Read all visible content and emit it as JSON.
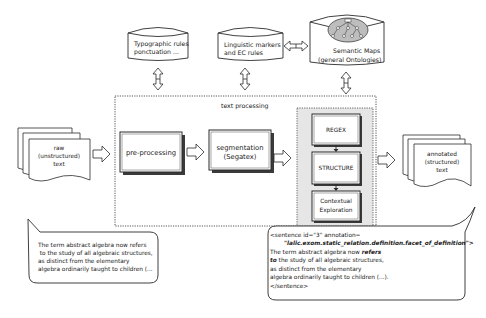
{
  "diagram": {
    "knowledge_bases": [
      {
        "id": "typographic",
        "lines": [
          "Typographic rules",
          "ponctuation ..."
        ]
      },
      {
        "id": "linguistic",
        "lines": [
          "Linguistic markers",
          "and EC rules"
        ]
      },
      {
        "id": "semantic",
        "lines": [
          "Semantic Maps",
          "(general Ontologies)"
        ]
      }
    ],
    "container_label": "text processing",
    "input_doc": {
      "lines": [
        "raw",
        "(unstructured)",
        "text"
      ]
    },
    "output_doc": {
      "lines": [
        "annotated",
        "(structured)",
        "text"
      ]
    },
    "steps": [
      {
        "id": "pre-processing",
        "lines": [
          "pre-processing"
        ]
      },
      {
        "id": "segmentation",
        "lines": [
          "segmentation",
          "(Segatex)"
        ]
      }
    ],
    "annotation_steps": [
      {
        "id": "regex",
        "lines": [
          "REGEX"
        ]
      },
      {
        "id": "structure",
        "lines": [
          "STRUCTURE"
        ]
      },
      {
        "id": "contextual",
        "lines": [
          "Contextual",
          "Exploration"
        ]
      }
    ],
    "input_example": {
      "lines": [
        "The term abstract algebra now refers",
        " to the study of all algebraic structures,",
        "as distinct from the elementary",
        "algebra ordinarily taught to children (..."
      ]
    },
    "output_example": {
      "tag_open": "<sentence id=\"3\" annotation=",
      "annotation_value": "\"lalic.exom.static_relation.definition.facet_of_definition\">",
      "line1_plain": "The term abstract algebra now ",
      "line1_bold": "refers",
      "line2_bold": "to",
      "line2_plain": " the study of all algebraic structures,",
      "line3": "as distinct from the elementary",
      "line4": "algebra ordinarily taught to children (...).",
      "tag_close": "</sentence>"
    }
  },
  "colors": {
    "stroke": "#2b2b2b",
    "shadow": "#3a3a3a",
    "inner_panel": "#e6e6e6",
    "ontology_fill": "#bdbdbd",
    "background": "#ffffff"
  }
}
